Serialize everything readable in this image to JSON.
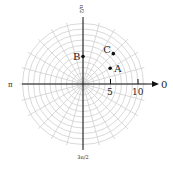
{
  "diagram": {
    "type": "polar-grid",
    "center": {
      "x": 83,
      "y": 84
    },
    "px_per_unit": 5.5,
    "ring_step": 1,
    "ring_count": 11,
    "spoke_step_deg": 15,
    "grid_color": "#cfcfcf",
    "axis_color": "#111111",
    "angle_labels": {
      "right": "0",
      "top": "π/2",
      "left": "π",
      "bottom": "3π/2"
    },
    "tick_labels": [
      {
        "value": 5,
        "label": "5"
      },
      {
        "value": 10,
        "label": "10"
      }
    ],
    "points": [
      {
        "name": "A",
        "r": 5.7,
        "theta_deg": 30
      },
      {
        "name": "B",
        "r": 5,
        "theta_deg": 90
      },
      {
        "name": "C",
        "r": 7.8,
        "theta_deg": 45
      }
    ]
  }
}
